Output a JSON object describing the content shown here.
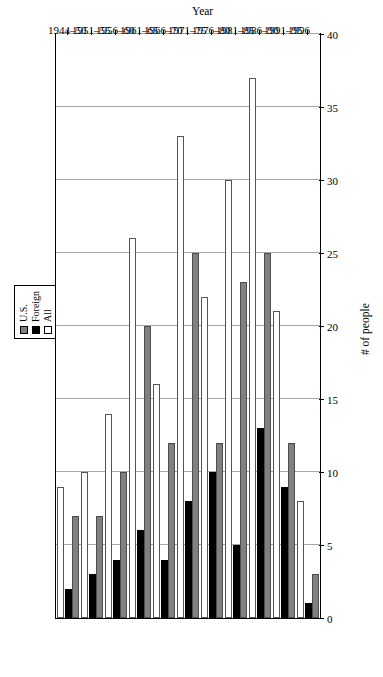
{
  "chart_data": {
    "type": "bar",
    "orientation": "horizontal",
    "title": "",
    "xlabel": "Year",
    "ylabel": "# of people",
    "categories": [
      "1944–50",
      "1951–55",
      "1956–60",
      "1961–65",
      "1966–70",
      "1971–75",
      "1976–80",
      "1981–85",
      "1986–90",
      "1991–95",
      "1996"
    ],
    "tick_labels": [
      "0",
      "5",
      "10",
      "15",
      "20",
      "25",
      "30",
      "35",
      "40"
    ],
    "ticks": [
      0,
      5,
      10,
      15,
      20,
      25,
      30,
      35,
      40
    ],
    "ylim": [
      0,
      40
    ],
    "grid": "value-axis-only",
    "legend_position": "top",
    "series": [
      {
        "name": "U.S.",
        "color": "#808080",
        "values": [
          7,
          7,
          10,
          20,
          12,
          25,
          12,
          23,
          25,
          12,
          3
        ]
      },
      {
        "name": "Foreign",
        "color": "#000000",
        "values": [
          2,
          3,
          4,
          6,
          4,
          8,
          10,
          5,
          13,
          9,
          1
        ]
      },
      {
        "name": "All",
        "color": "#ffffff",
        "values": [
          9,
          10,
          14,
          26,
          16,
          33,
          22,
          30,
          37,
          21,
          8
        ]
      }
    ]
  },
  "legend": {
    "items": [
      {
        "label": "U.S.",
        "swatch": "#808080"
      },
      {
        "label": "Foreign",
        "swatch": "#000000"
      },
      {
        "label": "All",
        "swatch": "#ffffff"
      }
    ]
  },
  "axes": {
    "x_title": "Year",
    "y_title": "# of people"
  }
}
